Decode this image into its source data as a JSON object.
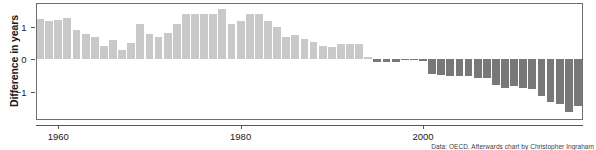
{
  "chart_data": {
    "type": "bar",
    "title": "",
    "subtitle": "",
    "xlabel": "",
    "ylabel": "Difference in years",
    "xlim": [
      1957.5,
      2017.5
    ],
    "ylim": [
      -1.85,
      1.75
    ],
    "grid": false,
    "legend": null,
    "xticks": [
      1960,
      1980,
      2000
    ],
    "xtick_labels": [
      "1960",
      "1980",
      "2000"
    ],
    "yticks": [
      -1,
      0,
      1
    ],
    "ytick_labels": [
      "-1",
      "0",
      "1"
    ],
    "colors": {
      "positive": "#c9c9c9",
      "negative": "#787878",
      "axis": "#555555",
      "frame": "#6e6e6e",
      "text": "#1a1a1a"
    },
    "x": [
      1958,
      1959,
      1960,
      1961,
      1962,
      1963,
      1964,
      1965,
      1966,
      1967,
      1968,
      1969,
      1970,
      1971,
      1972,
      1973,
      1974,
      1975,
      1976,
      1977,
      1978,
      1979,
      1980,
      1981,
      1982,
      1983,
      1984,
      1985,
      1986,
      1987,
      1988,
      1989,
      1990,
      1991,
      1992,
      1993,
      1994,
      1995,
      1996,
      1997,
      1998,
      1999,
      2000,
      2001,
      2002,
      2003,
      2004,
      2005,
      2006,
      2007,
      2008,
      2009,
      2010,
      2011,
      2012,
      2013,
      2014,
      2015,
      2016,
      2017
    ],
    "values": [
      1.25,
      1.18,
      1.2,
      1.27,
      0.9,
      0.78,
      0.7,
      0.42,
      0.6,
      0.3,
      0.5,
      1.08,
      0.78,
      0.7,
      0.8,
      1.1,
      1.4,
      1.4,
      1.4,
      1.4,
      1.56,
      1.08,
      1.18,
      1.4,
      1.4,
      1.18,
      1.0,
      0.68,
      0.76,
      0.62,
      0.52,
      0.4,
      0.38,
      0.48,
      0.46,
      0.46,
      0.06,
      -0.07,
      -0.07,
      -0.07,
      -0.02,
      -0.02,
      -0.05,
      -0.45,
      -0.48,
      -0.52,
      -0.5,
      -0.52,
      -0.58,
      -0.57,
      -0.8,
      -0.88,
      -0.82,
      -0.88,
      -0.92,
      -1.12,
      -1.3,
      -1.38,
      -1.62,
      -1.42
    ],
    "labels": {
      "caption": "Data: OECD. Afterwards chart by Christopher Ingraham"
    }
  },
  "figure": {
    "caption": "Data: OECD. Afterwards chart by Christopher Ingraham"
  }
}
